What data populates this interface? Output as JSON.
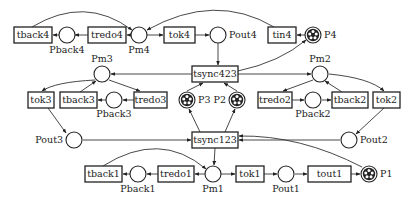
{
  "diagram": {
    "type": "petri-net",
    "colors": {
      "stroke": "#222222",
      "background": "#ffffff",
      "token": "#222222"
    },
    "places": [
      {
        "id": "Pback4",
        "label": "Pback4",
        "x": 67,
        "y": 35,
        "lx": 67,
        "ly": 53,
        "anchor": "middle",
        "tokens": 0
      },
      {
        "id": "Pm4",
        "label": "Pm4",
        "x": 139,
        "y": 35,
        "lx": 139,
        "ly": 53,
        "anchor": "middle",
        "tokens": 0
      },
      {
        "id": "Pout4",
        "label": "Pout4",
        "x": 218,
        "y": 35,
        "lx": 229,
        "ly": 38,
        "anchor": "start",
        "tokens": 0
      },
      {
        "id": "P4",
        "label": "P4",
        "x": 313,
        "y": 35,
        "lx": 324,
        "ly": 38,
        "anchor": "start",
        "tokens": 5
      },
      {
        "id": "Pm3",
        "label": "Pm3",
        "x": 102,
        "y": 74,
        "lx": 102,
        "ly": 62,
        "anchor": "middle",
        "tokens": 0
      },
      {
        "id": "Pm2",
        "label": "Pm2",
        "x": 320,
        "y": 74,
        "lx": 320,
        "ly": 62,
        "anchor": "middle",
        "tokens": 0
      },
      {
        "id": "Pback3",
        "label": "Pback3",
        "x": 114,
        "y": 100,
        "lx": 114,
        "ly": 117,
        "anchor": "middle",
        "tokens": 0
      },
      {
        "id": "P3",
        "label": "P3",
        "x": 187,
        "y": 100,
        "lx": 198,
        "ly": 103,
        "anchor": "start",
        "tokens": 5
      },
      {
        "id": "P2",
        "label": "P2",
        "x": 237,
        "y": 100,
        "lx": 226,
        "ly": 103,
        "anchor": "end",
        "tokens": 5
      },
      {
        "id": "Pback2",
        "label": "Pback2",
        "x": 313,
        "y": 100,
        "lx": 313,
        "ly": 117,
        "anchor": "middle",
        "tokens": 0
      },
      {
        "id": "Pout3",
        "label": "Pout3",
        "x": 74,
        "y": 140,
        "lx": 63,
        "ly": 143,
        "anchor": "end",
        "tokens": 0
      },
      {
        "id": "Pout2",
        "label": "Pout2",
        "x": 349,
        "y": 140,
        "lx": 360,
        "ly": 143,
        "anchor": "start",
        "tokens": 0
      },
      {
        "id": "Pback1",
        "label": "Pback1",
        "x": 138,
        "y": 174,
        "lx": 138,
        "ly": 192,
        "anchor": "middle",
        "tokens": 0
      },
      {
        "id": "Pm1",
        "label": "Pm1",
        "x": 213,
        "y": 174,
        "lx": 213,
        "ly": 192,
        "anchor": "middle",
        "tokens": 0
      },
      {
        "id": "Pout1",
        "label": "Pout1",
        "x": 286,
        "y": 174,
        "lx": 286,
        "ly": 192,
        "anchor": "middle",
        "tokens": 0
      },
      {
        "id": "P1",
        "label": "P1",
        "x": 369,
        "y": 174,
        "lx": 380,
        "ly": 177,
        "anchor": "start",
        "tokens": 5
      }
    ],
    "transitions": [
      {
        "id": "tback4",
        "label": "tback4",
        "x": 14,
        "y": 27,
        "w": 38,
        "h": 16
      },
      {
        "id": "tredo4",
        "label": "tredo4",
        "x": 88,
        "y": 27,
        "w": 38,
        "h": 16
      },
      {
        "id": "tok4",
        "label": "tok4",
        "x": 164,
        "y": 27,
        "w": 31,
        "h": 16
      },
      {
        "id": "tin4",
        "label": "tin4",
        "x": 268,
        "y": 27,
        "w": 28,
        "h": 16
      },
      {
        "id": "tsync423",
        "label": "tsync423",
        "x": 192,
        "y": 66,
        "w": 46,
        "h": 16
      },
      {
        "id": "tok3",
        "label": "tok3",
        "x": 28,
        "y": 92,
        "w": 26,
        "h": 16
      },
      {
        "id": "tback3",
        "label": "tback3",
        "x": 60,
        "y": 92,
        "w": 37,
        "h": 16
      },
      {
        "id": "tredo3",
        "label": "tredo3",
        "x": 134,
        "y": 92,
        "w": 33,
        "h": 16
      },
      {
        "id": "tredo2",
        "label": "tredo2",
        "x": 258,
        "y": 92,
        "w": 34,
        "h": 16
      },
      {
        "id": "tback2",
        "label": "tback2",
        "x": 332,
        "y": 92,
        "w": 36,
        "h": 16
      },
      {
        "id": "tok2",
        "label": "tok2",
        "x": 373,
        "y": 92,
        "w": 27,
        "h": 16
      },
      {
        "id": "tsync123",
        "label": "tsync123",
        "x": 192,
        "y": 132,
        "w": 46,
        "h": 16
      },
      {
        "id": "tback1",
        "label": "tback1",
        "x": 85,
        "y": 166,
        "w": 37,
        "h": 16
      },
      {
        "id": "tredo1",
        "label": "tredo1",
        "x": 158,
        "y": 166,
        "w": 36,
        "h": 16
      },
      {
        "id": "tok1",
        "label": "tok1",
        "x": 236,
        "y": 166,
        "w": 28,
        "h": 16
      },
      {
        "id": "tout1",
        "label": "tout1",
        "x": 308,
        "y": 166,
        "w": 43,
        "h": 16
      }
    ],
    "arcs": [
      {
        "d": "M88,35 L75,35"
      },
      {
        "d": "M59,35 L53,35"
      },
      {
        "d": "M131,35 L127,35"
      },
      {
        "d": "M147,35 L163,35"
      },
      {
        "d": "M195,35 L209,35"
      },
      {
        "d": "M32,27 Q85,-5 132,30"
      },
      {
        "d": "M274,27 Q215,-8 147,30"
      },
      {
        "d": "M305,35 L297,35"
      },
      {
        "d": "M218,43 L218,65"
      },
      {
        "d": "M238,71 Q280,62 306,40"
      },
      {
        "d": "M192,74 L111,74"
      },
      {
        "d": "M238,74 L311,74"
      },
      {
        "d": "M95,80 Q55,82 42,91"
      },
      {
        "d": "M80,92 L96,81"
      },
      {
        "d": "M109,80 L140,91"
      },
      {
        "d": "M134,100 L123,100"
      },
      {
        "d": "M106,100 L98,100"
      },
      {
        "d": "M48,108 L66,133"
      },
      {
        "d": "M83,140 L191,140"
      },
      {
        "d": "M200,132 L189,109"
      },
      {
        "d": "M225,132 L235,109"
      },
      {
        "d": "M187,91 L203,83"
      },
      {
        "d": "M237,91 L224,83"
      },
      {
        "d": "M313,80 L283,91"
      },
      {
        "d": "M292,100 L304,100"
      },
      {
        "d": "M322,100 L331,100"
      },
      {
        "d": "M342,92 L325,81"
      },
      {
        "d": "M329,74 Q370,78 384,91"
      },
      {
        "d": "M384,108 L356,134"
      },
      {
        "d": "M340,140 L239,140"
      },
      {
        "d": "M362,167 Q300,135 239,136"
      },
      {
        "d": "M215,148 L214,165"
      },
      {
        "d": "M205,174 L195,174"
      },
      {
        "d": "M158,174 L147,174"
      },
      {
        "d": "M130,174 L123,174"
      },
      {
        "d": "M103,166 Q160,130 206,169"
      },
      {
        "d": "M221,174 L235,174"
      },
      {
        "d": "M264,174 L277,174"
      },
      {
        "d": "M295,174 L307,174"
      },
      {
        "d": "M351,174 L360,174"
      }
    ]
  }
}
